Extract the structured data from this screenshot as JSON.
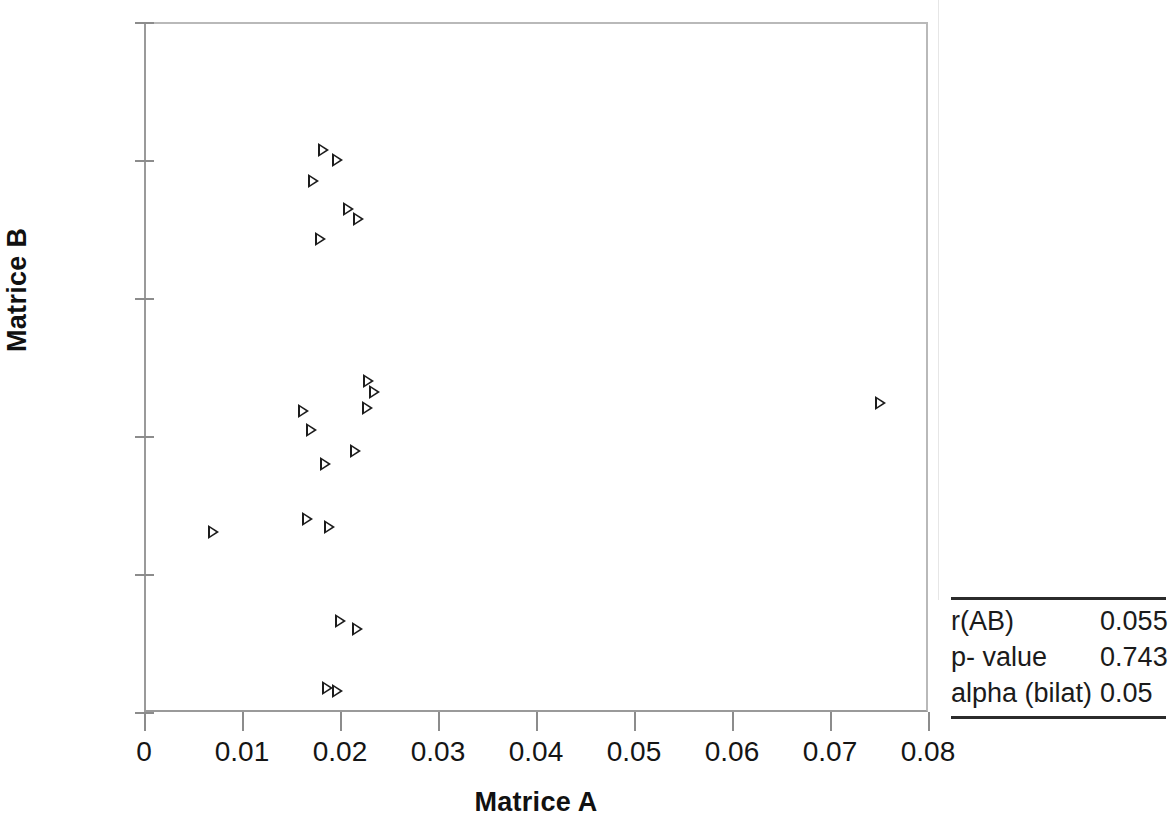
{
  "chart_data": {
    "type": "scatter",
    "title": "",
    "xlabel": "Matrice A",
    "ylabel": "Matrice B",
    "xlim": [
      0,
      0.08
    ],
    "ylim": [
      0,
      2500
    ],
    "xticks": [
      "0",
      "0.01",
      "0.02",
      "0.03",
      "0.04",
      "0.05",
      "0.06",
      "0.07",
      "0.08"
    ],
    "xtick_values": [
      0,
      0.01,
      0.02,
      0.03,
      0.04,
      0.05,
      0.06,
      0.07,
      0.08
    ],
    "yticks": [
      "0",
      "500",
      "1000",
      "1500",
      "2000",
      "2500"
    ],
    "ytick_values": [
      0,
      500,
      1000,
      1500,
      2000,
      2500
    ],
    "grid": false,
    "legend": null,
    "marker": "right-pointing-triangle-outline",
    "marker_color": "#1c1c1c",
    "series": [
      {
        "name": "Matrice A vs Matrice B",
        "points": [
          {
            "x": 0.0183,
            "y": 2036
          },
          {
            "x": 0.0197,
            "y": 1999
          },
          {
            "x": 0.0172,
            "y": 1923
          },
          {
            "x": 0.0208,
            "y": 1822
          },
          {
            "x": 0.0218,
            "y": 1786
          },
          {
            "x": 0.018,
            "y": 1714
          },
          {
            "x": 0.0229,
            "y": 1199
          },
          {
            "x": 0.0235,
            "y": 1159
          },
          {
            "x": 0.0751,
            "y": 1120
          },
          {
            "x": 0.0228,
            "y": 1101
          },
          {
            "x": 0.0162,
            "y": 1090
          },
          {
            "x": 0.017,
            "y": 1022
          },
          {
            "x": 0.0215,
            "y": 946
          },
          {
            "x": 0.0185,
            "y": 898
          },
          {
            "x": 0.0166,
            "y": 699
          },
          {
            "x": 0.0189,
            "y": 670
          },
          {
            "x": 0.007,
            "y": 652
          },
          {
            "x": 0.02,
            "y": 330
          },
          {
            "x": 0.0217,
            "y": 301
          },
          {
            "x": 0.0187,
            "y": 87
          },
          {
            "x": 0.0197,
            "y": 76
          }
        ]
      }
    ]
  },
  "stats": {
    "rows": [
      {
        "label": "r(AB)",
        "value": "0.055"
      },
      {
        "label": "p- value",
        "value": "0.743"
      },
      {
        "label": "alpha (bilat)",
        "value": "0.05"
      }
    ]
  }
}
